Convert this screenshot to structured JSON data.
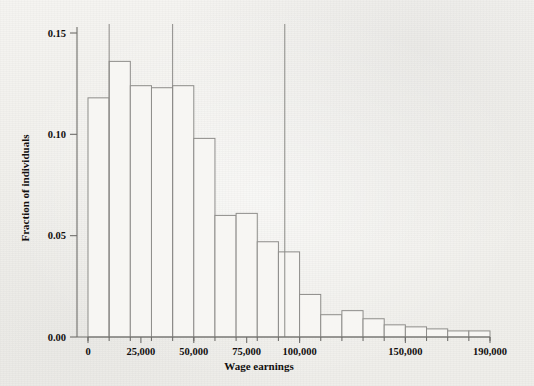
{
  "chart_data": {
    "type": "bar",
    "title": "",
    "subtitle": "",
    "xlabel": "Wage earnings",
    "ylabel": "Fraction of individuals",
    "xlim": [
      0,
      190000
    ],
    "ylim": [
      0.0,
      0.155
    ],
    "bin_width": 10000,
    "grid": false,
    "legend": null,
    "x_tick_labels": [
      "0",
      "25,000",
      "50,000",
      "75,000",
      "100,000",
      "150,000",
      "190,000"
    ],
    "x_tick_values": [
      0,
      25000,
      50000,
      75000,
      100000,
      150000,
      190000
    ],
    "y_tick_labels": [
      "0.00",
      "0.05",
      "0.10",
      "0.15"
    ],
    "y_tick_values": [
      0.0,
      0.05,
      0.1,
      0.15
    ],
    "categories": [
      "0-10,000",
      "10,000-20,000",
      "20,000-30,000",
      "30,000-40,000",
      "40,000-50,000",
      "50,000-60,000",
      "60,000-70,000",
      "70,000-80,000",
      "80,000-90,000",
      "90,000-100,000",
      "100,000-110,000",
      "110,000-120,000",
      "120,000-130,000",
      "130,000-140,000",
      "140,000-150,000",
      "150,000-160,000",
      "160,000-170,000",
      "170,000-180,000",
      "180,000-190,000"
    ],
    "bin_edges": [
      0,
      10000,
      20000,
      30000,
      40000,
      50000,
      60000,
      70000,
      80000,
      90000,
      100000,
      110000,
      120000,
      130000,
      140000,
      150000,
      160000,
      170000,
      180000,
      190000
    ],
    "values": [
      0.118,
      0.136,
      0.124,
      0.123,
      0.124,
      0.098,
      0.06,
      0.061,
      0.047,
      0.042,
      0.021,
      0.011,
      0.013,
      0.009,
      0.006,
      0.005,
      0.004,
      0.003,
      0.003
    ],
    "annotations": [
      {
        "name": "reference-line-1",
        "type": "vline",
        "x": 10000
      },
      {
        "name": "reference-line-2",
        "type": "vline",
        "x": 40000
      },
      {
        "name": "reference-line-3",
        "type": "vline",
        "x": 93000
      }
    ],
    "colors": {
      "bar_fill": "#f7f6f3",
      "bar_stroke": "#8e8d8a",
      "axis": "#6f6e6b",
      "refline": "#8c8b88",
      "text": "#12100f",
      "background": "#f1f0ec"
    }
  }
}
